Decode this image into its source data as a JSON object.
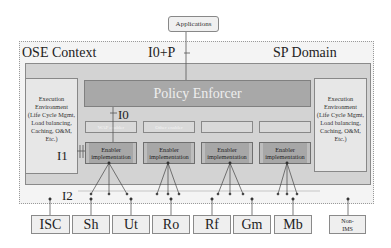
{
  "applications": {
    "label": "Applications"
  },
  "ose": {
    "context_label": "OSE Context",
    "interface_top_label": "I0+P",
    "domain_label": "SP Domain"
  },
  "execution_environment": {
    "left": {
      "line1": "Execution",
      "line2": "Environment",
      "line3": "(Life Cycle Mgmt,",
      "line4": "Load balancing,",
      "line5": "Caching, O&M,",
      "line6": "Etc.)"
    },
    "right": {
      "line1": "Execution",
      "line2": "Environment",
      "line3": "(Life Cycle Mgmt,",
      "line4": "Load balancing,",
      "line5": "Caching, O&M,",
      "line6": "Etc.)"
    }
  },
  "policy_enforcer": {
    "label": "Policy Enforcer"
  },
  "interfaces": {
    "i0": "I0",
    "i1": "I1",
    "i2": "I2"
  },
  "enabler_slots": [
    {
      "label": "WAP enabler"
    },
    {
      "label": "Other enabler"
    },
    {
      "label": ""
    },
    {
      "label": ""
    }
  ],
  "enablers": [
    {
      "line1": "Enabler",
      "line2": "implementation"
    },
    {
      "line1": "Enabler",
      "line2": "implementation"
    },
    {
      "line1": "Enabler",
      "line2": "implementation"
    },
    {
      "line1": "Enabler",
      "line2": "implementation"
    }
  ],
  "bottom_interfaces": [
    {
      "label": "ISC"
    },
    {
      "label": "Sh"
    },
    {
      "label": "Ut"
    },
    {
      "label": "Ro"
    },
    {
      "label": "Rf"
    },
    {
      "label": "Gm"
    },
    {
      "label": "Mb"
    }
  ],
  "non_ims": {
    "line1": "Non-",
    "line2": "IMS"
  }
}
